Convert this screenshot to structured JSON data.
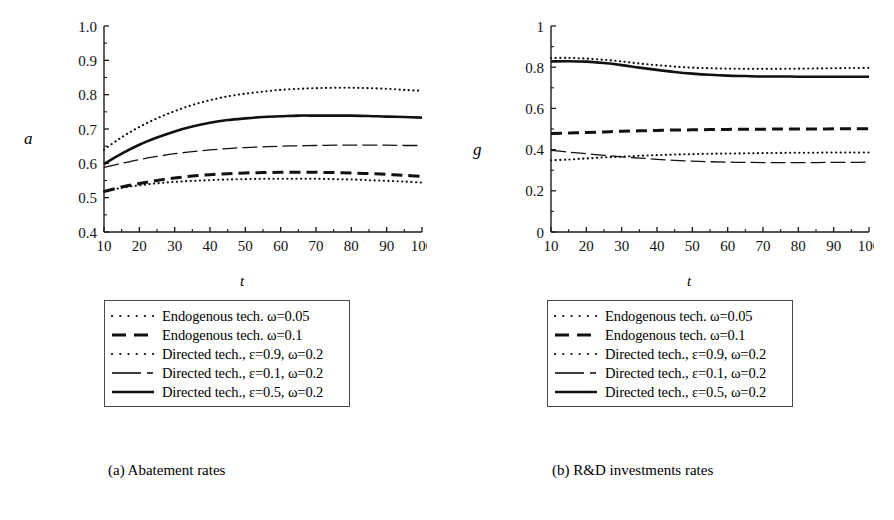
{
  "figure": {
    "panels": [
      {
        "id": "a",
        "caption": "(a) Abatement rates",
        "ylabel": "a",
        "xlabel": "t"
      },
      {
        "id": "b",
        "caption": "(b) R&D investments rates",
        "ylabel": "g",
        "xlabel": "t"
      }
    ],
    "legend_entries": [
      {
        "label": "Endogenous tech. ω=0.05",
        "style": "fine-dotted"
      },
      {
        "label": "Endogenous tech. ω=0.1",
        "style": "thick-dashed"
      },
      {
        "label": "Directed tech., ε=0.9, ω=0.2",
        "style": "fine-dotted"
      },
      {
        "label": "Directed tech., ε=0.1, ω=0.2",
        "style": "thin-dash-dot"
      },
      {
        "label": "Directed tech., ε=0.5, ω=0.2",
        "style": "thick-solid"
      }
    ]
  },
  "chart_data": [
    {
      "type": "line",
      "panel": "a",
      "title": "(a) Abatement rates",
      "xlabel": "t",
      "ylabel": "a",
      "xlim": [
        10,
        100
      ],
      "ylim": [
        0.4,
        1.0
      ],
      "xticks": [
        10,
        20,
        30,
        40,
        50,
        60,
        70,
        80,
        90,
        100
      ],
      "yticks": [
        0.4,
        0.5,
        0.6,
        0.7,
        0.8,
        0.9,
        1.0
      ],
      "ytick_labels": [
        "0.4",
        "0.5",
        "0.6",
        "0.7",
        "0.8",
        "0.9",
        "1.0"
      ],
      "minor_ticks": true,
      "grid": false,
      "legend_position": "below",
      "x": [
        10,
        15,
        20,
        25,
        30,
        35,
        40,
        45,
        50,
        55,
        60,
        65,
        70,
        75,
        80,
        85,
        90,
        95,
        100
      ],
      "series": [
        {
          "name": "Endogenous tech. ω=0.05",
          "style": "fine-dotted",
          "values": [
            0.518,
            0.529,
            0.536,
            0.542,
            0.546,
            0.549,
            0.551,
            0.553,
            0.554,
            0.555,
            0.555,
            0.555,
            0.555,
            0.554,
            0.553,
            0.551,
            0.549,
            0.547,
            0.544
          ]
        },
        {
          "name": "Endogenous tech. ω=0.1",
          "style": "thick-dashed",
          "values": [
            0.518,
            0.531,
            0.541,
            0.55,
            0.557,
            0.563,
            0.567,
            0.57,
            0.572,
            0.573,
            0.574,
            0.574,
            0.574,
            0.573,
            0.572,
            0.57,
            0.568,
            0.565,
            0.562
          ]
        },
        {
          "name": "Directed tech., ε=0.9, ω=0.2",
          "style": "fine-dotted",
          "values": [
            0.64,
            0.676,
            0.706,
            0.731,
            0.752,
            0.77,
            0.784,
            0.795,
            0.803,
            0.809,
            0.814,
            0.817,
            0.819,
            0.82,
            0.82,
            0.819,
            0.817,
            0.814,
            0.811
          ]
        },
        {
          "name": "Directed tech., ε=0.1, ω=0.2",
          "style": "thin-dash-dot",
          "values": [
            0.588,
            0.6,
            0.611,
            0.62,
            0.628,
            0.634,
            0.639,
            0.643,
            0.646,
            0.648,
            0.65,
            0.651,
            0.652,
            0.653,
            0.653,
            0.653,
            0.653,
            0.652,
            0.652
          ]
        },
        {
          "name": "Directed tech., ε=0.5, ω=0.2",
          "style": "thick-solid",
          "values": [
            0.598,
            0.628,
            0.654,
            0.675,
            0.693,
            0.707,
            0.718,
            0.726,
            0.731,
            0.735,
            0.737,
            0.739,
            0.739,
            0.739,
            0.739,
            0.738,
            0.736,
            0.735,
            0.733
          ]
        }
      ]
    },
    {
      "type": "line",
      "panel": "b",
      "title": "(b) R&D investments rates",
      "xlabel": "t",
      "ylabel": "g",
      "xlim": [
        10,
        100
      ],
      "ylim": [
        0,
        1
      ],
      "xticks": [
        10,
        20,
        30,
        40,
        50,
        60,
        70,
        80,
        90,
        100
      ],
      "yticks": [
        0,
        0.2,
        0.4,
        0.6,
        0.8,
        1
      ],
      "ytick_labels": [
        "0",
        "0.2",
        "0.4",
        "0.6",
        "0.8",
        "1"
      ],
      "minor_ticks": true,
      "grid": false,
      "legend_position": "below",
      "x": [
        10,
        15,
        20,
        25,
        30,
        35,
        40,
        45,
        50,
        55,
        60,
        65,
        70,
        75,
        80,
        85,
        90,
        95,
        100
      ],
      "series": [
        {
          "name": "Endogenous tech. ω=0.05",
          "style": "fine-dotted",
          "values": [
            0.348,
            0.352,
            0.357,
            0.362,
            0.366,
            0.37,
            0.373,
            0.376,
            0.378,
            0.38,
            0.381,
            0.382,
            0.383,
            0.384,
            0.385,
            0.385,
            0.386,
            0.386,
            0.386
          ]
        },
        {
          "name": "Endogenous tech. ω=0.1",
          "style": "thick-dashed",
          "values": [
            0.478,
            0.48,
            0.483,
            0.486,
            0.489,
            0.491,
            0.493,
            0.495,
            0.496,
            0.497,
            0.498,
            0.499,
            0.499,
            0.5,
            0.5,
            0.5,
            0.501,
            0.501,
            0.501
          ]
        },
        {
          "name": "Directed tech., ε=0.9, ω=0.2",
          "style": "fine-dotted",
          "values": [
            0.845,
            0.845,
            0.842,
            0.836,
            0.828,
            0.818,
            0.81,
            0.803,
            0.798,
            0.795,
            0.793,
            0.792,
            0.792,
            0.792,
            0.793,
            0.794,
            0.795,
            0.796,
            0.797
          ]
        },
        {
          "name": "Directed tech., ε=0.1, ω=0.2",
          "style": "thin-dash-dot",
          "values": [
            0.396,
            0.388,
            0.38,
            0.372,
            0.365,
            0.359,
            0.353,
            0.348,
            0.344,
            0.341,
            0.339,
            0.338,
            0.337,
            0.337,
            0.337,
            0.337,
            0.338,
            0.338,
            0.339
          ]
        },
        {
          "name": "Directed tech., ε=0.5, ω=0.2",
          "style": "thick-solid",
          "values": [
            0.828,
            0.829,
            0.827,
            0.82,
            0.81,
            0.798,
            0.787,
            0.777,
            0.769,
            0.763,
            0.759,
            0.757,
            0.755,
            0.755,
            0.754,
            0.754,
            0.754,
            0.754,
            0.754
          ]
        }
      ]
    }
  ]
}
